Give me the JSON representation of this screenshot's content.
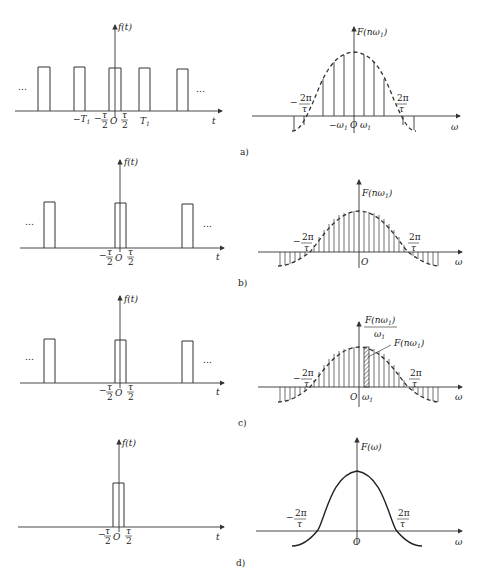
{
  "figure": {
    "panels": [
      {
        "caption": "a)",
        "time": {
          "y_label": "f(t)",
          "x_label": "t",
          "ticks": [
            "-T₁",
            "-τ/2",
            "O",
            "τ/2",
            "T₁"
          ],
          "ellipsis_left": "…",
          "ellipsis_right": "…"
        },
        "spectrum": {
          "y_label": "F(nω₁)",
          "x_label": "ω",
          "ticks": [
            "-2π/τ",
            "-ω₁",
            "O",
            "ω₁",
            "2π/τ"
          ]
        }
      },
      {
        "caption": "b)",
        "time": {
          "y_label": "f(t)",
          "x_label": "t",
          "ticks": [
            "-τ/2",
            "O",
            "τ/2"
          ],
          "ellipsis_left": "…",
          "ellipsis_right": "…"
        },
        "spectrum": {
          "y_label": "F(nω₁)",
          "x_label": "ω",
          "ticks": [
            "-2π/τ",
            "O",
            "2π/τ"
          ]
        }
      },
      {
        "caption": "c)",
        "time": {
          "y_label": "f(t)",
          "x_label": "t",
          "ticks": [
            "-τ/2",
            "O",
            "τ/2"
          ],
          "ellipsis_left": "…",
          "ellipsis_right": "…"
        },
        "spectrum": {
          "y_label_num": "F(nω₁)",
          "y_label_den": "ω₁",
          "annotation": "F(nω₁)",
          "x_label": "ω",
          "ticks": [
            "-2π/τ",
            "O",
            "ω₁",
            "2π/τ"
          ]
        }
      },
      {
        "caption": "d)",
        "time": {
          "y_label": "f(t)",
          "x_label": "t",
          "ticks": [
            "-τ/2",
            "O",
            "τ/2"
          ]
        },
        "spectrum": {
          "y_label": "F(ω)",
          "x_label": "ω",
          "ticks": [
            "-2π/τ",
            "O",
            "2π/τ"
          ]
        }
      }
    ]
  },
  "text": {
    "dots": "…",
    "f_t": "f(t)",
    "t": "t",
    "omega": "ω",
    "O": "O",
    "T1": "T",
    "sub1": "1",
    "minus": "−",
    "tau": "τ",
    "two": "2",
    "twopi": "2π",
    "F_nw1": "F(nω",
    "close_paren": ")",
    "w": "ω",
    "F_w": "F(ω)",
    "cap_a": "a)",
    "cap_b": "b)",
    "cap_c": "c)",
    "cap_d": "d)"
  }
}
